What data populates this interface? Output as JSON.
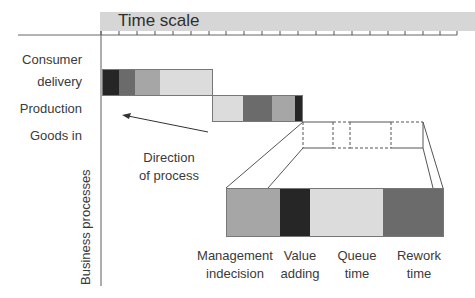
{
  "time_scale": {
    "title": "Time scale",
    "tick_count": 20
  },
  "axis": {
    "vertical_label": "Business processes"
  },
  "rows": [
    {
      "label": "Consumer"
    },
    {
      "label": "delivery"
    },
    {
      "label": "Production"
    },
    {
      "label": "Goods in"
    }
  ],
  "arrow": {
    "label_line1": "Direction",
    "label_line2": "of process"
  },
  "legend": [
    {
      "line1": "Management",
      "line2": "indecision",
      "color": "#a6a6a6"
    },
    {
      "line1": "Value",
      "line2": "adding",
      "color": "#262626"
    },
    {
      "line1": "Queue",
      "line2": "time",
      "color": "#dcdcdc"
    },
    {
      "line1": "Rework",
      "line2": "time",
      "color": "#6b6b6b"
    }
  ],
  "bars": {
    "consumer_delivery": [
      "#262626",
      "#6b6b6b",
      "#a6a6a6",
      "#dcdcdc"
    ],
    "production": [
      "#dcdcdc",
      "#6b6b6b",
      "#a6a6a6",
      "#262626"
    ]
  }
}
